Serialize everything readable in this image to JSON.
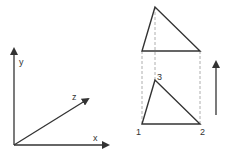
{
  "colors": {
    "stroke": "#333333",
    "dashed": "#999999",
    "background": "#ffffff"
  },
  "axes": {
    "x_label": "x",
    "y_label": "y",
    "z_label": "z"
  },
  "projection": {
    "top_triangle": {
      "apex": [
        155,
        7
      ],
      "base_left": [
        142,
        51
      ],
      "base_right": [
        200,
        51
      ]
    },
    "bottom_triangle": {
      "vertex_labels": [
        "1",
        "2",
        "3"
      ],
      "v1": [
        142,
        124
      ],
      "v2": [
        200,
        124
      ],
      "v3": [
        155,
        80
      ]
    },
    "direction_arrow": "up-arrow"
  }
}
